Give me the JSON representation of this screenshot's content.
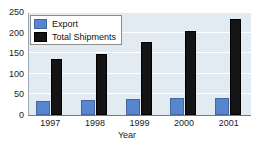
{
  "cutoff_strip": {
    "text": "····  ·····   ··  ····· ····· ····· ····· ····"
  },
  "colors": {
    "export": "#5785cf",
    "total_shipments": "#141414",
    "plot_background": "#e2eaf2",
    "gridline": "#ffffff",
    "axis": "#6f7c88",
    "text": "#1b1b1b"
  },
  "chart_data": {
    "type": "bar",
    "title": "",
    "xlabel": "Year",
    "ylabel": "",
    "categories": [
      "1997",
      "1998",
      "1999",
      "2000",
      "2001"
    ],
    "series": [
      {
        "name": "Export",
        "color": "#5785cf",
        "values": [
          33,
          36,
          39,
          41,
          42
        ]
      },
      {
        "name": "Total Shipments",
        "color": "#141414",
        "values": [
          135,
          149,
          178,
          203,
          232
        ]
      }
    ],
    "ylim": [
      0,
      250
    ],
    "yticks": [
      0,
      50,
      100,
      150,
      200,
      250
    ],
    "ytick_labels": [
      "0",
      "50",
      "100",
      "150",
      "200",
      "250"
    ],
    "grid": true,
    "grid_axis": "y",
    "legend": [
      "Export",
      "Total Shipments"
    ],
    "legend_position": "upper left"
  }
}
